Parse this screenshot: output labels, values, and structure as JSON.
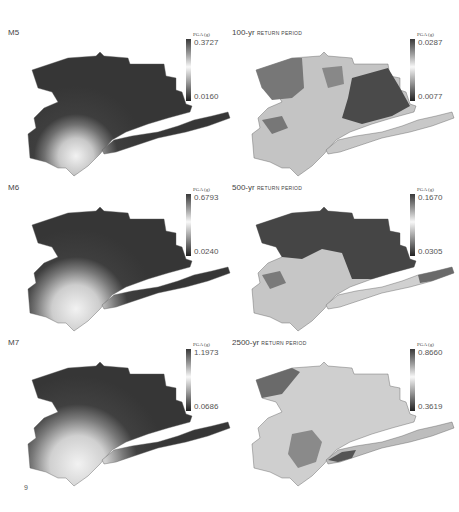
{
  "page": {
    "number": "9"
  },
  "panels": [
    {
      "id": "m5",
      "title": "M5",
      "title_suffix": "",
      "legend": {
        "label": "PGA (g)",
        "max": "0.3727",
        "min": "0.0160"
      }
    },
    {
      "id": "rp100",
      "title": "100-yr",
      "title_suffix": "return period",
      "legend": {
        "label": "PGA (g)",
        "max": "0.0287",
        "min": "0.0077"
      }
    },
    {
      "id": "m6",
      "title": "M6",
      "title_suffix": "",
      "legend": {
        "label": "PGA (g)",
        "max": "0.6793",
        "min": "0.0240"
      }
    },
    {
      "id": "rp500",
      "title": "500-yr",
      "title_suffix": "return period",
      "legend": {
        "label": "PGA (g)",
        "max": "0.1670",
        "min": "0.0305"
      }
    },
    {
      "id": "m7",
      "title": "M7",
      "title_suffix": "",
      "legend": {
        "label": "PGA (g)",
        "max": "1.1973",
        "min": "0.0686"
      }
    },
    {
      "id": "rp2500",
      "title": "2500-yr",
      "title_suffix": "return period",
      "legend": {
        "label": "PGA (g)",
        "max": "0.8660",
        "min": "0.3619"
      }
    }
  ],
  "colors": {
    "dark": "#3a3a3a",
    "mid": "#8a8a8a",
    "light": "#d8d8d8",
    "white": "#f4f4f4"
  }
}
